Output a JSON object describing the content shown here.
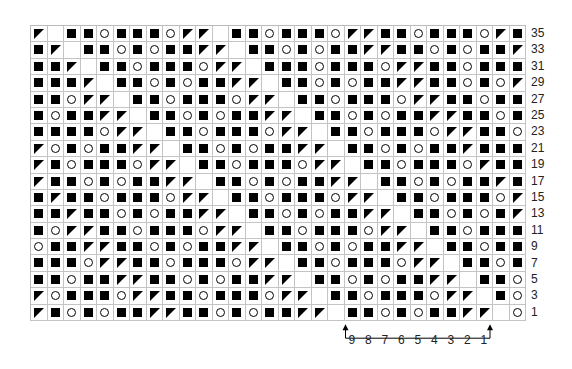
{
  "chart": {
    "type": "knitting-chart",
    "columns": 30,
    "legend_codes": {
      "S": "filled-square",
      "O": "yarn-over-circle",
      "T": "decrease-triangle",
      "_": "no-stitch"
    },
    "rows": [
      {
        "label": "35",
        "cells": "T_SSOSSSOTT_SSOSSSOTTSSOSSSOTS"
      },
      {
        "label": "33",
        "cells": "ST_SSOSOSSTT_SSOSOSSTTSSOSOSST"
      },
      {
        "label": "31",
        "cells": "SST_SSOSSSOTT_SSSOSSSOTTSSOSSS"
      },
      {
        "label": "29",
        "cells": "SSST_SSOSOSSTT_SSOSOSSTTSSOSOT"
      },
      {
        "label": "27",
        "cells": "SSOTT_SSOSSSOTT_SSOSSSOTTSSOSS"
      },
      {
        "label": "25",
        "cells": "SOSSTT_SSOSOSSTT_SSOSOSSTTSSOS"
      },
      {
        "label": "23",
        "cells": "SSSSOTT_SSOSSSOTT_SSOSSSOTTSSO"
      },
      {
        "label": "21",
        "cells": "TOSOSSTT_SSOSOSSTT_SSOSOSSTSSS"
      },
      {
        "label": "19",
        "cells": "TSOSSSOTT_SSOSSSOTT_SSOSSSOTSS"
      },
      {
        "label": "17",
        "cells": "TSSOSOSSTT_SSOSOSSTT_SSOSOSSTS"
      },
      {
        "label": "15",
        "cells": "STSSOSSSOTT_SSOSSSOTT_SSOSSSOT"
      },
      {
        "label": "13",
        "cells": "SSTSSOSOSSTT_SSOSOSSTT_SSOSOST"
      },
      {
        "label": "11",
        "cells": "SOTTSSOSSSOTT_SSOSSSOTT_SSOSSS"
      },
      {
        "label": "9",
        "cells": "OSSTTSSOSOSSTT_SSOSOSSTT_SSOSS"
      },
      {
        "label": "7",
        "cells": "SSSOTTSSOSSSOTT_SSOSSSOTT_SSOS"
      },
      {
        "label": "5",
        "cells": "SSOSSTTSSOSOSSTT_SSOSOSSTT_SSO"
      },
      {
        "label": "3",
        "cells": "TOSSSOTTSSOSSSOTT_SSOSSSOTT_SO"
      },
      {
        "label": "1",
        "cells": "TSOSOSSTTSSOSOSSTT_SSOSOSSTT_O"
      }
    ],
    "repeat": {
      "start_col": 20,
      "end_col": 28,
      "labels": [
        "9",
        "8",
        "7",
        "6",
        "5",
        "4",
        "3",
        "2",
        "1"
      ]
    }
  }
}
